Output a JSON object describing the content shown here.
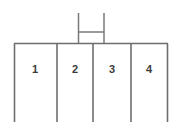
{
  "figure": {
    "type": "line-diagram",
    "width": 181,
    "height": 134,
    "background_color": "#ffffff",
    "line_color": "#6e6e6e",
    "label_color": "#3b3b3b",
    "title": ""
  },
  "container": {
    "left": 14,
    "right": 168,
    "top": 43,
    "bottom": 122,
    "has_bottom_edge": false,
    "compartment_count": 4,
    "divider_positions": [
      57,
      93,
      131
    ]
  },
  "compartments": [
    {
      "label": "1",
      "center_x": 35,
      "center_y": 69,
      "left": 14,
      "right": 57
    },
    {
      "label": "2",
      "center_x": 75,
      "center_y": 69,
      "left": 57,
      "right": 93
    },
    {
      "label": "3",
      "center_x": 112,
      "center_y": 69,
      "left": 93,
      "right": 131
    },
    {
      "label": "4",
      "center_x": 149,
      "center_y": 69,
      "left": 131,
      "right": 168
    }
  ],
  "handle": {
    "shape": "H",
    "left_leg_x": 78,
    "right_leg_x": 104,
    "top_y": 13,
    "bottom_y": 43,
    "crossbar_y": 32
  }
}
